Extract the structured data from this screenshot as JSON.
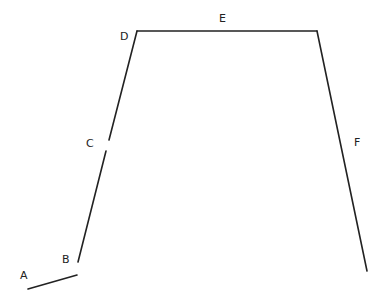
{
  "diagram": {
    "type": "polyline-segments",
    "stroke_color": "#222222",
    "background": "#ffffff",
    "labels": [
      {
        "text": "A",
        "x": 24,
        "y": 279
      },
      {
        "text": "B",
        "x": 66,
        "y": 263
      },
      {
        "text": "C",
        "x": 90,
        "y": 147
      },
      {
        "text": "D",
        "x": 124,
        "y": 40
      },
      {
        "text": "E",
        "x": 223,
        "y": 22
      },
      {
        "text": "F",
        "x": 358,
        "y": 146
      }
    ],
    "segments": [
      {
        "name": "A",
        "x1": 28,
        "y1": 289,
        "x2": 77,
        "y2": 275
      },
      {
        "name": "B-C",
        "x1": 78,
        "y1": 262,
        "x2": 106,
        "y2": 151
      },
      {
        "name": "C-D",
        "x1": 109,
        "y1": 140,
        "x2": 137,
        "y2": 31
      },
      {
        "name": "E",
        "x1": 137,
        "y1": 31,
        "x2": 317,
        "y2": 31
      },
      {
        "name": "F",
        "x1": 317,
        "y1": 31,
        "x2": 367,
        "y2": 271
      }
    ]
  }
}
